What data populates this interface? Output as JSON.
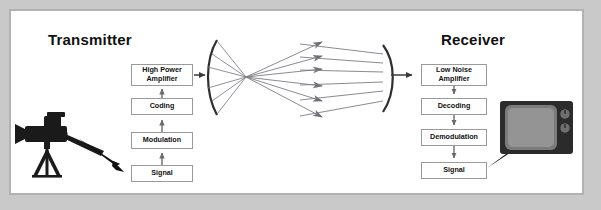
{
  "figure": {
    "background_color": "#c9c9c9",
    "panel_color": "#ffffff",
    "panel_border_color": "#b2b2b2"
  },
  "titles": {
    "transmitter": "Transmitter",
    "receiver": "Receiver"
  },
  "transmitter_chain": {
    "flow_direction": "upward",
    "blocks": [
      {
        "label": "Signal"
      },
      {
        "label": "Modulation"
      },
      {
        "label": "Coding"
      },
      {
        "label": "High Power\nAmplifier"
      }
    ]
  },
  "receiver_chain": {
    "flow_direction": "downward",
    "blocks": [
      {
        "label": "Low Noise\nAmplifier"
      },
      {
        "label": "Decoding"
      },
      {
        "label": "Demodulation"
      },
      {
        "label": "Signal"
      }
    ]
  },
  "devices": {
    "camera": {
      "name": "video-camera-on-tripod",
      "color": "#1a1a1a"
    },
    "television": {
      "name": "crt-television",
      "color": "#2b2b2b",
      "knob_count": 2
    }
  },
  "antennas": {
    "transmit_dish": {
      "name": "parabolic-reflector-transmit",
      "ray_count": 6,
      "color": "#6e6e74"
    },
    "receive_dish": {
      "name": "parabolic-reflector-receive",
      "ray_count": 6,
      "color": "#6e6e74"
    }
  },
  "connectors": {
    "camera_to_signal": "thick-tapered-arrow",
    "signal_to_television": "thick-tapered-arrow",
    "hpa_to_dish": "short-arrow",
    "dish_to_lna": "short-arrow",
    "chain_arrow_color": "#6a6a6a"
  }
}
